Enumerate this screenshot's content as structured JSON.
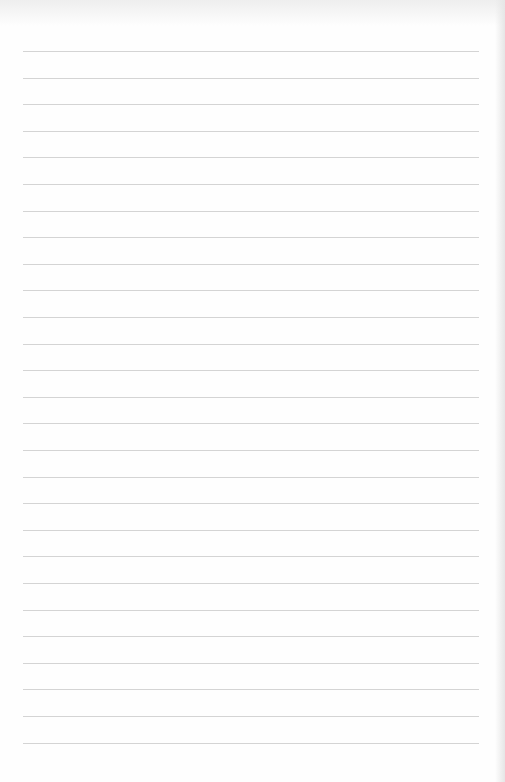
{
  "page": {
    "type": "lined-paper",
    "background_color": "#fefefe",
    "line_color": "#d4d4d4",
    "line_count": 27,
    "first_line_y": 51,
    "line_spacing": 26.6,
    "line_left": 23,
    "line_width": 456
  }
}
